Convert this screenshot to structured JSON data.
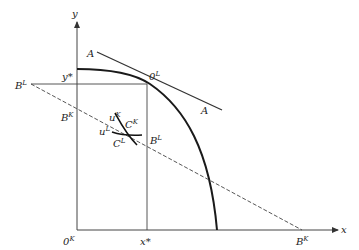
{
  "axes": {
    "y_label": "y",
    "x_label": "x"
  },
  "labels": {
    "y_star": "y*",
    "x_star": "x*",
    "origin_K": {
      "base": "0",
      "sup": "K"
    },
    "origin_L": {
      "base": "0",
      "sup": "L"
    },
    "A_top": "A",
    "A_bottom": "A",
    "B_L_left": {
      "base": "B",
      "sup": "L"
    },
    "B_K_left": {
      "base": "B",
      "sup": "K"
    },
    "B_L_mid": {
      "base": "B",
      "sup": "L"
    },
    "B_K_axis": {
      "base": "B",
      "sup": "K"
    },
    "u_K": {
      "base": "u",
      "sup": "K"
    },
    "u_L": {
      "base": "u",
      "sup": "L"
    },
    "C_K": {
      "base": "C",
      "sup": "K"
    },
    "C_L": {
      "base": "C",
      "sup": "L"
    }
  },
  "colors": {
    "line": "#333333",
    "curve": "#1a1a1a"
  }
}
